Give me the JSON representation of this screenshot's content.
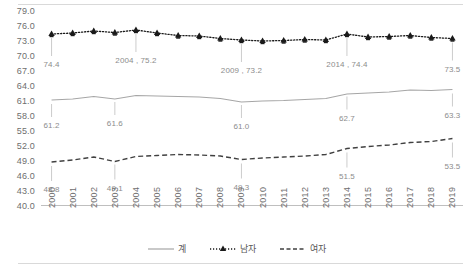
{
  "chart_data": {
    "type": "line",
    "title": "",
    "subtitle": "",
    "xlabel": "",
    "ylabel": "",
    "ylim": [
      40.0,
      79.0
    ],
    "ytick_step": 3.0,
    "grid": false,
    "legend_position": "bottom",
    "categories": [
      "2000",
      "2001",
      "2002",
      "2003",
      "2004",
      "2005",
      "2006",
      "2007",
      "2008",
      "2009",
      "2010",
      "2011",
      "2012",
      "2013",
      "2014",
      "2015",
      "2016",
      "2017",
      "2018",
      "2019"
    ],
    "yticks": [
      "40.0",
      "43.0",
      "46.0",
      "49.0",
      "52.0",
      "55.0",
      "58.0",
      "61.0",
      "64.0",
      "67.0",
      "70.0",
      "73.0",
      "76.0",
      "79.0"
    ],
    "series": [
      {
        "name": "계",
        "style": "solid",
        "marker": "none",
        "color": "#a6a6a6",
        "values": [
          61.2,
          61.4,
          61.9,
          61.4,
          62.1,
          62.0,
          61.9,
          61.8,
          61.5,
          60.8,
          61.0,
          61.1,
          61.3,
          61.5,
          62.4,
          62.6,
          62.8,
          63.2,
          63.1,
          63.3
        ]
      },
      {
        "name": "남자",
        "style": "dotted",
        "marker": "triangle",
        "color": "#1a1a1a",
        "values": [
          74.4,
          74.6,
          75.0,
          74.7,
          75.2,
          74.6,
          74.1,
          74.0,
          73.5,
          73.2,
          73.0,
          73.1,
          73.3,
          73.2,
          74.4,
          73.8,
          73.9,
          74.1,
          73.7,
          73.5
        ]
      },
      {
        "name": "여자",
        "style": "dashed",
        "marker": "none",
        "color": "#404040",
        "values": [
          48.8,
          49.2,
          49.8,
          48.9,
          49.9,
          50.1,
          50.3,
          50.2,
          50.0,
          49.3,
          49.6,
          49.8,
          50.0,
          50.3,
          51.5,
          51.9,
          52.2,
          52.7,
          52.9,
          53.5
        ]
      }
    ],
    "annotations": [
      {
        "series": "남자",
        "category": "2000",
        "text": "74.4",
        "value": 74.4
      },
      {
        "series": "남자",
        "category": "2004",
        "text": "2004 , 75.2",
        "value": 75.2
      },
      {
        "series": "남자",
        "category": "2009",
        "text": "2009 , 73.2",
        "value": 73.2
      },
      {
        "series": "남자",
        "category": "2014",
        "text": "2014 , 74.4",
        "value": 74.4
      },
      {
        "series": "남자",
        "category": "2019",
        "text": "73.5",
        "value": 73.5
      },
      {
        "series": "계",
        "category": "2000",
        "text": "61.2",
        "value": 61.2
      },
      {
        "series": "계",
        "category": "2003",
        "text": "61.6",
        "value": 61.6
      },
      {
        "series": "계",
        "category": "2009",
        "text": "61.0",
        "value": 61.0
      },
      {
        "series": "계",
        "category": "2014",
        "text": "62.7",
        "value": 62.7
      },
      {
        "series": "계",
        "category": "2019",
        "text": "63.3",
        "value": 63.3
      },
      {
        "series": "여자",
        "category": "2000",
        "text": "48.8",
        "value": 48.8
      },
      {
        "series": "여자",
        "category": "2003",
        "text": "49.1",
        "value": 49.1
      },
      {
        "series": "여자",
        "category": "2009",
        "text": "49.3",
        "value": 49.3
      },
      {
        "series": "여자",
        "category": "2014",
        "text": "51.5",
        "value": 51.5
      },
      {
        "series": "여자",
        "category": "2019",
        "text": "53.5",
        "value": 53.5
      }
    ]
  },
  "legend": {
    "items": [
      {
        "label": "계"
      },
      {
        "label": "남자"
      },
      {
        "label": "여자"
      }
    ]
  }
}
